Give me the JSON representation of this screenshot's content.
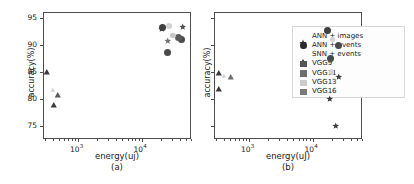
{
  "figure": {
    "panels": [
      {
        "id": "a",
        "sublabel": "(a)",
        "xlabel": "energy(uj)",
        "ylabel": "accuracy(%)",
        "show_yticks": true
      },
      {
        "id": "b",
        "sublabel": "(b)",
        "xlabel": "energy(uJ)",
        "ylabel": "accuracy(%)",
        "show_yticks": false
      }
    ]
  },
  "legend": {
    "position": "right-inside-panel-b",
    "entries": [
      {
        "label": "ANN + images",
        "marker": "star",
        "color": "#2b2b2b"
      },
      {
        "label": "ANN + events",
        "marker": "circle",
        "color": "#2b2b2b"
      },
      {
        "label": "SNN + events",
        "marker": "triangle",
        "color": "#2b2b2b"
      },
      {
        "label": "VGG9",
        "marker": "square",
        "color": "#555555"
      },
      {
        "label": "VGG11",
        "marker": "square",
        "color": "#6e6e6e"
      },
      {
        "label": "VGG13",
        "marker": "square",
        "color": "#cccccc"
      },
      {
        "label": "VGG16",
        "marker": "square",
        "color": "#7a7a7a"
      }
    ]
  },
  "axis_ticks": {
    "y_labels": [
      "95",
      "90",
      "85",
      "80",
      "75"
    ],
    "x_labels": [
      "10",
      "10"
    ],
    "x_exponents": [
      "3",
      "4"
    ]
  },
  "chart_data": [
    {
      "type": "scatter",
      "panel": "a",
      "title": "(a)",
      "xlabel": "energy(uj)",
      "ylabel": "accuracy(%)",
      "xscale": "log",
      "xlim": [
        280,
        60000
      ],
      "ylim": [
        72.5,
        96.2
      ],
      "grid": false,
      "legend_position": "none",
      "series": [
        {
          "name": "ANN + images",
          "marker": "star",
          "points": [
            {
              "x": 21000,
              "y": 94.4,
              "model": "VGG9",
              "color": "#3a3a3a"
            },
            {
              "x": 44000,
              "y": 94.9,
              "model": "VGG11",
              "color": "#4a4a4a"
            },
            {
              "x": 26000,
              "y": 92.2,
              "model": "VGG16",
              "color": "#707070"
            }
          ]
        },
        {
          "name": "ANN + events",
          "marker": "circle",
          "points": [
            {
              "x": 21500,
              "y": 93.3,
              "model": "VGG9",
              "color": "#3f3f3f"
            },
            {
              "x": 43000,
              "y": 91.1,
              "model": "VGG11",
              "color": "#4a4a4a"
            },
            {
              "x": 38000,
              "y": 91.4,
              "model": "VGG13",
              "color": "#5a5a5a"
            },
            {
              "x": 25500,
              "y": 88.7,
              "model": "VGG16",
              "color": "#4a4a4a"
            }
          ]
        },
        {
          "name": "SNN + events",
          "marker": "triangle",
          "points": [
            {
              "x": 320,
              "y": 86.4,
              "model": "VGG9",
              "color": "#3a3a3a"
            },
            {
              "x": 420,
              "y": 80.2,
              "model": "VGG11",
              "color": "#3a3a3a"
            },
            {
              "x": 470,
              "y": 82.1,
              "model": "VGG16",
              "color": "#5a5a5a"
            }
          ]
        },
        {
          "name": "VGG13 light markers",
          "marker": "mixed-light",
          "points": [
            {
              "x": 27000,
              "y": 93.6,
              "model": "VGG13",
              "color": "#d2d2d2"
            },
            {
              "x": 400,
              "y": 83.4,
              "model": "VGG13",
              "color": "#d2d2d2"
            },
            {
              "x": 31000,
              "y": 91.8,
              "model": "VGG13",
              "color": "#c6c6c6"
            }
          ]
        }
      ]
    },
    {
      "type": "scatter",
      "panel": "b",
      "title": "(b)",
      "xlabel": "energy(uJ)",
      "ylabel": "accuracy(%)",
      "xscale": "log",
      "xlim": [
        280,
        60000
      ],
      "ylim": [
        72.5,
        96.2
      ],
      "grid": false,
      "legend_position": "right",
      "series": [
        {
          "name": "ANN + events",
          "marker": "circle",
          "points": [
            {
              "x": 17000,
              "y": 92.8,
              "model": "VGG9",
              "color": "#3f3f3f"
            },
            {
              "x": 26000,
              "y": 90.0,
              "model": "VGG11",
              "color": "#4a4a4a"
            },
            {
              "x": 19000,
              "y": 87.6,
              "model": "VGG16",
              "color": "#4a4a4a"
            }
          ]
        },
        {
          "name": "SNN + events",
          "marker": "triangle",
          "points": [
            {
              "x": 330,
              "y": 86.3,
              "model": "VGG9",
              "color": "#3a3a3a"
            },
            {
              "x": 330,
              "y": 83.3,
              "model": "VGG11",
              "color": "#3a3a3a"
            },
            {
              "x": 520,
              "y": 85.6,
              "model": "VGG16",
              "color": "#707070"
            }
          ]
        },
        {
          "name": "ANN + images",
          "marker": "star",
          "points": [
            {
              "x": 26000,
              "y": 85.6,
              "model": "VGG9",
              "color": "#3a3a3a"
            },
            {
              "x": 18500,
              "y": 81.5,
              "model": "VGG11",
              "color": "#3a3a3a"
            },
            {
              "x": 23000,
              "y": 76.4,
              "model": "VGG16",
              "color": "#3a3a3a"
            }
          ]
        },
        {
          "name": "VGG13 light markers",
          "marker": "mixed-light",
          "points": [
            {
              "x": 20500,
              "y": 91.1,
              "model": "VGG13",
              "color": "#d2d2d2"
            },
            {
              "x": 400,
              "y": 86.0,
              "model": "VGG13",
              "color": "#d2d2d2"
            },
            {
              "x": 20000,
              "y": 85.0,
              "model": "VGG13",
              "color": "#d2d2d2"
            }
          ]
        }
      ]
    }
  ]
}
